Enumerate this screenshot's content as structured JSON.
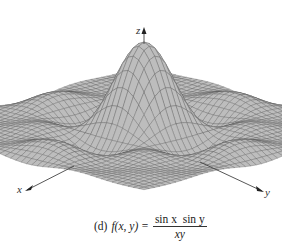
{
  "figure": {
    "caption_label": "(d)",
    "function_lhs": "f(x, y) =",
    "numerator": "sin x  sin y",
    "denominator": "xy",
    "expression": "f(x, y) = sin x sin y / (xy)"
  },
  "axes": {
    "x_label": "x",
    "y_label": "y",
    "z_label": "z"
  },
  "colors": {
    "surface_fill": "#bdbdbd",
    "mesh_line": "#5a5a5a",
    "axis": "#444444",
    "background": "#ffffff"
  },
  "surface": {
    "type": "3d-surface",
    "function": "sin(x)*sin(y)/(x*y)",
    "domain_x": [
      -10,
      10
    ],
    "domain_y": [
      -10,
      10
    ],
    "peak_value": 1
  }
}
